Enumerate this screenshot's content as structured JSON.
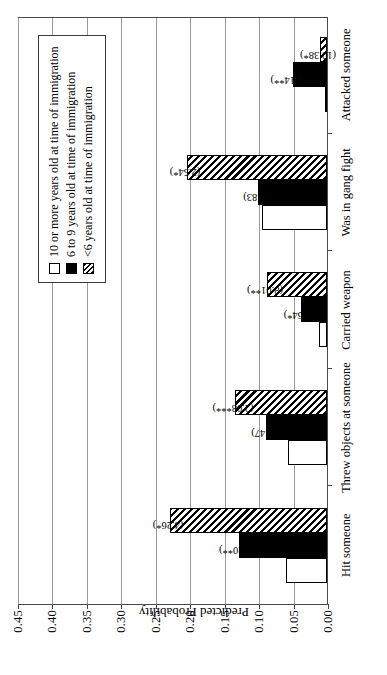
{
  "chart_data": {
    "type": "bar",
    "orientation": "vertical-grouped",
    "title": "",
    "xlabel": "",
    "ylabel": "Predicted Probability",
    "ylim": [
      0.0,
      0.45
    ],
    "ytick_labels": [
      "0.00",
      "0.05",
      "0.10",
      "0.15",
      "0.20",
      "0.25",
      "0.30",
      "0.35",
      "0.40",
      "0.45"
    ],
    "ytick_values": [
      0.0,
      0.05,
      0.1,
      0.15,
      0.2,
      0.25,
      0.3,
      0.35,
      0.4,
      0.45
    ],
    "grid": true,
    "legend_position": "upper-right",
    "categories": [
      "Hit someone",
      "Threw objects at someone",
      "Carried weapon",
      "Was in gang fight",
      "Attacked someone"
    ],
    "series": [
      {
        "name": "10 or more years old at time of immigration",
        "style": "white",
        "values": [
          0.06,
          0.057,
          0.011,
          0.095,
          0.002
        ],
        "annotations": [
          "",
          "",
          "",
          "",
          ""
        ]
      },
      {
        "name": "6 to 9 years old at time of immigration",
        "style": "black",
        "values": [
          0.128,
          0.088,
          0.038,
          0.1,
          0.05
        ],
        "annotations": [
          "(2.20**)",
          "(1.47)",
          "(3.64*)",
          "(0.83)",
          "(95.14**)"
        ]
      },
      {
        "name": "<6 years old at time of immigration",
        "style": "hatch",
        "values": [
          0.228,
          0.133,
          0.087,
          0.203,
          0.01
        ],
        "annotations": [
          "(4.26*)",
          "(2.08***)",
          "(8.01**)",
          "(2.54*)",
          "(10.38*)"
        ]
      }
    ]
  },
  "axis": {
    "y_title": "Predicted Probability"
  },
  "legend": {
    "entries": [
      {
        "label": "10 or more years old at time of immigration",
        "style": "white"
      },
      {
        "label": "6 to 9 years old at time of immigration",
        "style": "black"
      },
      {
        "label": "<6 years old at time of immigration",
        "style": "hatch"
      }
    ]
  }
}
